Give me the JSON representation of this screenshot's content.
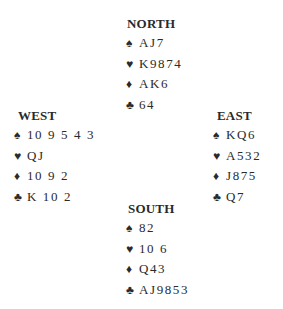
{
  "hands": {
    "north": {
      "title": "NORTH",
      "spades": "AJ7",
      "hearts": "K9874",
      "diamonds": "AK6",
      "clubs": "64"
    },
    "west": {
      "title": "WEST",
      "spades": "10 9 5 4 3",
      "hearts": "QJ",
      "diamonds": "10 9 2",
      "clubs": "K 10 2"
    },
    "east": {
      "title": "EAST",
      "spades": "KQ6",
      "hearts": "A532",
      "diamonds": "J875",
      "clubs": "Q7"
    },
    "south": {
      "title": "SOUTH",
      "spades": "82",
      "hearts": "10 6",
      "diamonds": "Q43",
      "clubs": "AJ9853"
    }
  },
  "suits": {
    "spade": "♠",
    "heart": "♥",
    "diamond": "♦",
    "club": "♣"
  }
}
